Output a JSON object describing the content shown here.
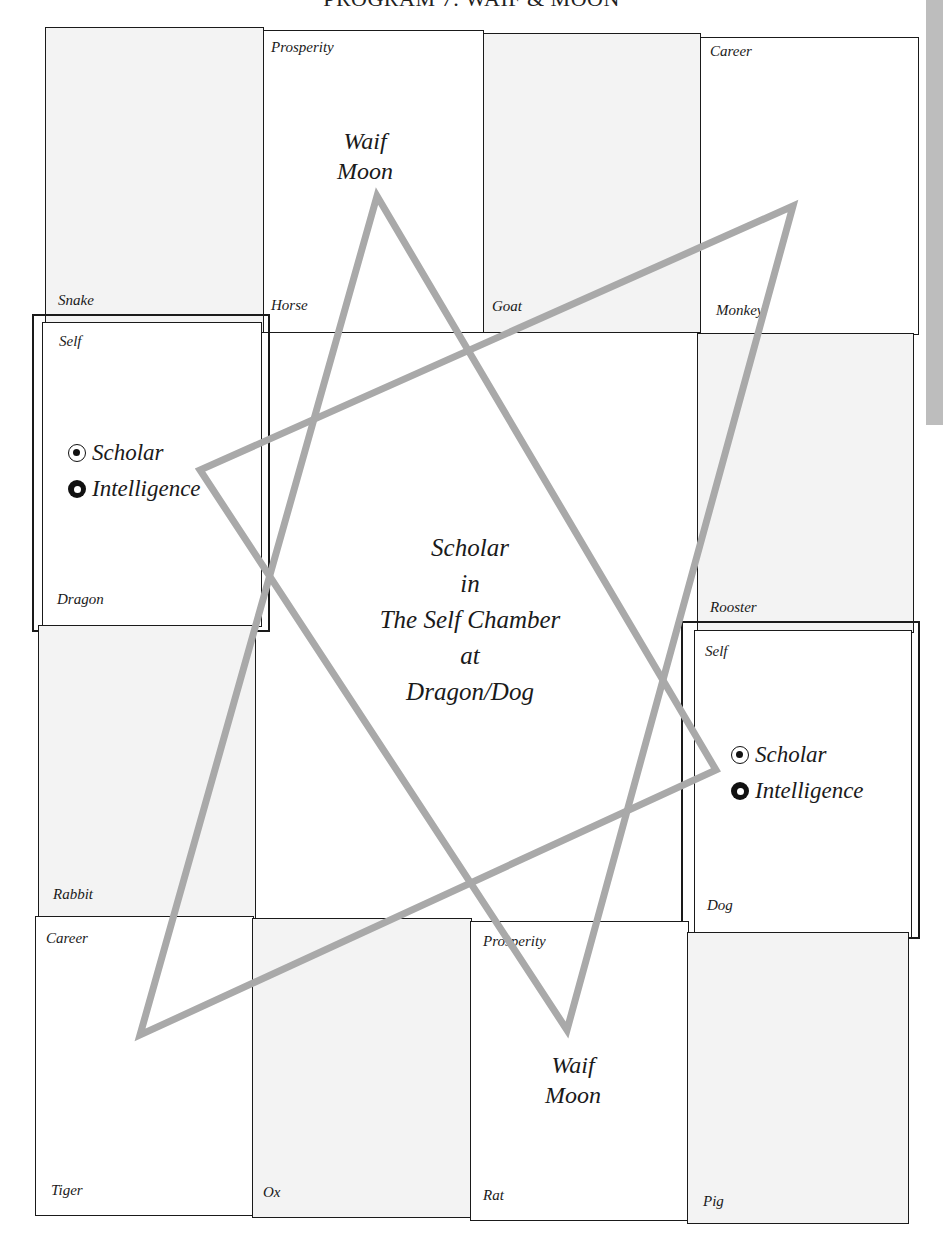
{
  "header": {
    "title": "PROGRAM 7: WAIF & MOON"
  },
  "grid": {
    "top_row": [
      {
        "palace": "",
        "branch": "Snake",
        "shade": true
      },
      {
        "palace": "Prosperity",
        "branch": "Horse",
        "shade": false
      },
      {
        "palace": "",
        "branch": "Goat",
        "shade": true
      },
      {
        "palace": "Career",
        "branch": "Monkey",
        "shade": false
      }
    ],
    "left_col": [
      {
        "palace": "Self",
        "branch": "Dragon",
        "shade": false
      },
      {
        "palace": "",
        "branch": "Rabbit",
        "shade": true
      }
    ],
    "right_col": [
      {
        "palace": "",
        "branch": "Rooster",
        "shade": true
      },
      {
        "palace": "Self",
        "branch": "Dog",
        "shade": false
      }
    ],
    "bottom_row": [
      {
        "palace": "Career",
        "branch": "Tiger",
        "shade": false
      },
      {
        "palace": "",
        "branch": "Ox",
        "shade": true
      },
      {
        "palace": "Prosperity",
        "branch": "Rat",
        "shade": false
      },
      {
        "palace": "",
        "branch": "Pig",
        "shade": true
      }
    ]
  },
  "stars": {
    "dragon": [
      {
        "name": "Scholar",
        "icon": "dot-in-circle-icon"
      },
      {
        "name": "Intelligence",
        "icon": "ring-icon"
      }
    ],
    "dog": [
      {
        "name": "Scholar",
        "icon": "dot-in-circle-icon"
      },
      {
        "name": "Intelligence",
        "icon": "ring-icon"
      }
    ]
  },
  "markers": {
    "top": {
      "line1": "Waif",
      "line2": "Moon"
    },
    "bottom": {
      "line1": "Waif",
      "line2": "Moon"
    }
  },
  "center": {
    "lines": [
      "Scholar",
      "in",
      "The Self Chamber",
      "at",
      "Dragon/Dog"
    ]
  },
  "colors": {
    "shade": "#f3f3f3",
    "triangle": "#a9a9a9",
    "grid_line": "#1a1a1a",
    "edge_strip": "#bdbdbd"
  }
}
